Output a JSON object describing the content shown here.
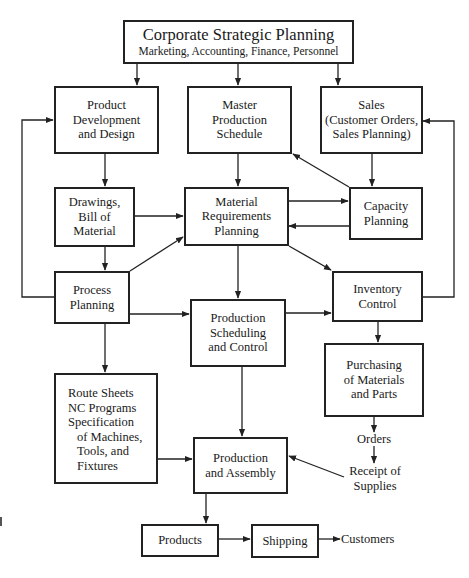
{
  "diagram": {
    "type": "flowchart",
    "colors": {
      "stroke": "#222222",
      "background": "#ffffff",
      "text": "#1a1a1a"
    },
    "nodes": {
      "corporate": {
        "title": "Corporate Strategic Planning",
        "subtitle": "Marketing, Accounting, Finance, Personnel"
      },
      "product_dev": {
        "lines": [
          "Product",
          "Development",
          "and Design"
        ]
      },
      "master_prod": {
        "lines": [
          "Master",
          "Production",
          "Schedule"
        ]
      },
      "sales": {
        "lines": [
          "Sales",
          "(Customer Orders,",
          "Sales Planning)"
        ]
      },
      "drawings": {
        "lines": [
          "Drawings,",
          "Bill of",
          "Material"
        ]
      },
      "mrp": {
        "lines": [
          "Material",
          "Requirements",
          "Planning"
        ]
      },
      "capacity": {
        "lines": [
          "Capacity",
          "Planning"
        ]
      },
      "process": {
        "lines": [
          "Process",
          "Planning"
        ]
      },
      "prod_sched": {
        "lines": [
          "Production",
          "Scheduling",
          "and Control"
        ]
      },
      "inventory": {
        "lines": [
          "Inventory",
          "Control"
        ]
      },
      "purchasing": {
        "lines": [
          "Purchasing",
          "of Materials",
          "and Parts"
        ]
      },
      "route": {
        "lines": [
          "Route Sheets",
          "NC Programs",
          "Specification",
          "of Machines,",
          "Tools, and",
          "Fixtures"
        ]
      },
      "prod_assembly": {
        "lines": [
          "Production",
          "and Assembly"
        ]
      },
      "products": {
        "lines": [
          "Products"
        ]
      },
      "shipping": {
        "lines": [
          "Shipping"
        ]
      }
    },
    "labels": {
      "orders": "Orders",
      "receipt": [
        "Receipt of",
        "Supplies"
      ],
      "customers": "Customers"
    },
    "edges": [
      {
        "from": "corporate",
        "to": "product_dev"
      },
      {
        "from": "corporate",
        "to": "master_prod"
      },
      {
        "from": "corporate",
        "to": "sales"
      },
      {
        "from": "product_dev",
        "to": "drawings"
      },
      {
        "from": "master_prod",
        "to": "mrp"
      },
      {
        "from": "sales",
        "to": "capacity"
      },
      {
        "from": "capacity",
        "to": "master_prod"
      },
      {
        "from": "drawings",
        "to": "mrp"
      },
      {
        "from": "mrp",
        "to": "capacity"
      },
      {
        "from": "capacity",
        "to": "mrp"
      },
      {
        "from": "drawings",
        "to": "process"
      },
      {
        "from": "process",
        "to": "mrp"
      },
      {
        "from": "process",
        "to": "product_dev"
      },
      {
        "from": "mrp",
        "to": "prod_sched"
      },
      {
        "from": "mrp",
        "to": "inventory"
      },
      {
        "from": "process",
        "to": "prod_sched"
      },
      {
        "from": "prod_sched",
        "to": "inventory"
      },
      {
        "from": "inventory",
        "to": "sales"
      },
      {
        "from": "inventory",
        "to": "purchasing"
      },
      {
        "from": "process",
        "to": "route"
      },
      {
        "from": "purchasing",
        "to": "orders"
      },
      {
        "from": "orders",
        "to": "receipt"
      },
      {
        "from": "receipt",
        "to": "prod_assembly"
      },
      {
        "from": "route",
        "to": "prod_assembly"
      },
      {
        "from": "prod_sched",
        "to": "prod_assembly"
      },
      {
        "from": "prod_assembly",
        "to": "products"
      },
      {
        "from": "products",
        "to": "shipping"
      },
      {
        "from": "shipping",
        "to": "customers"
      }
    ]
  }
}
